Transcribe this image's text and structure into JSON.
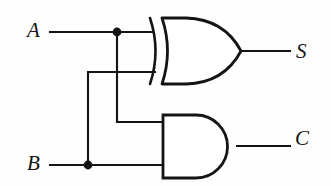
{
  "diagram": {
    "type": "logic-circuit",
    "background_color": "#fefefe",
    "line_color": "#141414",
    "stroke_width": 2.1
  },
  "inputs": [
    {
      "id": "A",
      "label": "A",
      "x": 27,
      "y": 20,
      "wire_y": 32
    },
    {
      "id": "B",
      "label": "B",
      "x": 27,
      "y": 153,
      "wire_y": 165
    }
  ],
  "outputs": [
    {
      "id": "S",
      "label": "S",
      "x": 296,
      "y": 41,
      "wire_y": 51,
      "source_gate": "xor-gate"
    },
    {
      "id": "C",
      "label": "C",
      "x": 295,
      "y": 128,
      "wire_y": 146,
      "source_gate": "and-gate"
    }
  ],
  "gates": [
    {
      "id": "xor-gate",
      "type": "XOR",
      "name": "exclusive-or-gate",
      "body_left": 162,
      "body_right": 241,
      "top": 18,
      "bottom": 84,
      "tip_x": 241,
      "tip_y": 51,
      "back_arc_x": 150,
      "inputs": [
        {
          "from": "A",
          "y": 32
        },
        {
          "from": "B",
          "y": 72
        }
      ],
      "output": "S"
    },
    {
      "id": "and-gate",
      "type": "AND",
      "name": "and-gate",
      "body_left": 163,
      "body_right": 237,
      "top": 115,
      "bottom": 178,
      "tip_x": 237,
      "tip_y": 146,
      "inputs": [
        {
          "from": "A",
          "y": 122
        },
        {
          "from": "B",
          "y": 165
        }
      ],
      "output": "C"
    }
  ],
  "junctions": [
    {
      "id": "junction-A",
      "label": "A-branch-dot",
      "x": 117,
      "y": 32,
      "radius": 4.2
    },
    {
      "id": "junction-B",
      "label": "B-branch-dot",
      "x": 88,
      "y": 165,
      "radius": 4.2
    }
  ],
  "wires": [
    {
      "id": "wire-a-main",
      "name": "a-input-to-xor",
      "path": "M 50 32 L 152 32"
    },
    {
      "id": "wire-a-branch-down",
      "name": "a-branch-down-to-and",
      "path": "M 117 32 L 117 122 L 163 122"
    },
    {
      "id": "wire-b-main",
      "name": "b-input-to-and",
      "path": "M 50 165 L 163 165"
    },
    {
      "id": "wire-b-branch-up",
      "name": "b-branch-up-to-xor",
      "path": "M 88 165 L 88 72 L 155 72"
    },
    {
      "id": "wire-s-out",
      "name": "xor-output-to-s",
      "path": "M 241 51 L 290 51"
    },
    {
      "id": "wire-c-out",
      "name": "and-output-to-c",
      "path": "M 237 146 L 290 146"
    }
  ],
  "truth_table_note": ""
}
